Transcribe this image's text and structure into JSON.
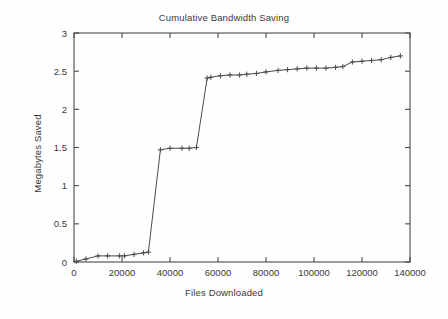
{
  "chart_data": {
    "type": "line",
    "title": "Cumulative Bandwidth Saving",
    "xlabel": "Files Downloaded",
    "ylabel": "Megabytes Saved",
    "xlim": [
      0,
      140000
    ],
    "ylim": [
      0,
      3
    ],
    "xticks": [
      0,
      20000,
      40000,
      60000,
      80000,
      100000,
      120000,
      140000
    ],
    "xtick_labels": [
      "0",
      "20000",
      "40000",
      "60000",
      "80000",
      "100000",
      "120000",
      "140000"
    ],
    "yticks": [
      0,
      0.5,
      1,
      1.5,
      2,
      2.5,
      3
    ],
    "ytick_labels": [
      "0",
      "0.5",
      "1",
      "1.5",
      "2",
      "2.5",
      "3"
    ],
    "grid": false,
    "legend": null,
    "marker": "plus",
    "line_color": "#4a4a4a",
    "background_color": "#fefefe",
    "series": [
      {
        "name": "Cumulative bandwidth saved",
        "x": [
          1000,
          5000,
          10000,
          14000,
          19000,
          21000,
          25000,
          29000,
          31000,
          36000,
          40000,
          45000,
          48000,
          51000,
          55500,
          57000,
          61000,
          65000,
          69000,
          72000,
          76000,
          80000,
          85000,
          89000,
          93000,
          97000,
          101000,
          105000,
          109000,
          112000,
          116000,
          120000,
          124000,
          128000,
          132000,
          136000
        ],
        "y": [
          0.01,
          0.04,
          0.08,
          0.08,
          0.08,
          0.08,
          0.1,
          0.12,
          0.13,
          1.47,
          1.49,
          1.49,
          1.49,
          1.5,
          2.41,
          2.42,
          2.44,
          2.45,
          2.45,
          2.46,
          2.47,
          2.49,
          2.51,
          2.52,
          2.53,
          2.54,
          2.54,
          2.54,
          2.55,
          2.56,
          2.62,
          2.63,
          2.64,
          2.65,
          2.68,
          2.7
        ]
      }
    ]
  },
  "figure": {
    "title": "Cumulative Bandwidth Saving",
    "xlabel": "Files Downloaded",
    "ylabel": "Megabytes Saved"
  }
}
